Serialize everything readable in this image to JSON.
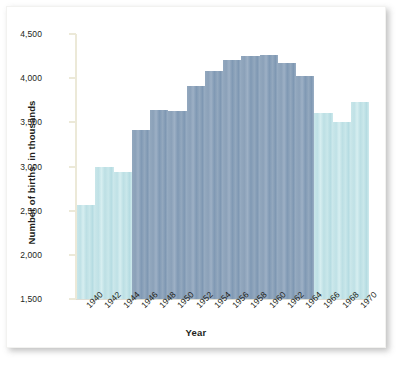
{
  "chart_data": {
    "type": "bar",
    "title": "",
    "xlabel": "Year",
    "ylabel": "Number of births, in thousands",
    "ylim": [
      1500,
      4500
    ],
    "ytick_labels": [
      "4,500",
      "4,000",
      "3,500",
      "3,000",
      "2,500",
      "2,000",
      "1,500"
    ],
    "ytick_values": [
      4500,
      4000,
      3500,
      3000,
      2500,
      2000,
      1500
    ],
    "grid": false,
    "legend": "none",
    "categories": [
      "1940",
      "1942",
      "1944",
      "1946",
      "1948",
      "1950",
      "1952",
      "1954",
      "1956",
      "1958",
      "1960",
      "1962",
      "1964",
      "1966",
      "1968",
      "1970"
    ],
    "values": [
      2559,
      2989,
      2939,
      3411,
      3637,
      3632,
      3909,
      4078,
      4210,
      4255,
      4258,
      4167,
      4027,
      3606,
      3502,
      3731
    ],
    "series": [
      {
        "name": "Number of births",
        "values": [
          2559,
          2989,
          2939,
          3411,
          3637,
          3632,
          3909,
          4078,
          4210,
          4255,
          4258,
          4167,
          4027,
          3606,
          3502,
          3731
        ]
      }
    ],
    "bar_highlight_flags": [
      false,
      false,
      false,
      true,
      true,
      true,
      true,
      true,
      true,
      true,
      true,
      true,
      true,
      false,
      false,
      false
    ],
    "colors": {
      "bar_light": "#c4e4e8",
      "bar_dark": "#8fa4bb",
      "axis": "#ece9d8",
      "text": "#231f20",
      "background": "#ffffff"
    }
  }
}
